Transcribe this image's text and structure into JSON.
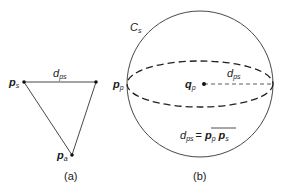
{
  "panel_a": {
    "caption": "(a)",
    "points": {
      "ps": {
        "main": "p",
        "sub": "s"
      },
      "pa": {
        "main": "p",
        "sub": "a"
      }
    },
    "edge_label": {
      "main": "d",
      "sub": "ps"
    }
  },
  "panel_b": {
    "caption": "(b)",
    "sphere_label": {
      "main": "C",
      "sub": "s"
    },
    "left_point": {
      "main": "p",
      "sub": "p"
    },
    "center_point": {
      "main": "q",
      "sub": "p"
    },
    "radius_label": {
      "main": "d",
      "sub": "ps"
    },
    "equation": {
      "lhs_main": "d",
      "lhs_sub": "ps",
      "eq": "=",
      "p1_main": "p",
      "p1_sub": "p",
      "p2_main": "p",
      "p2_sub": "s"
    }
  },
  "colors": {
    "stroke": "#1a1a1a",
    "background": "#ffffff"
  }
}
